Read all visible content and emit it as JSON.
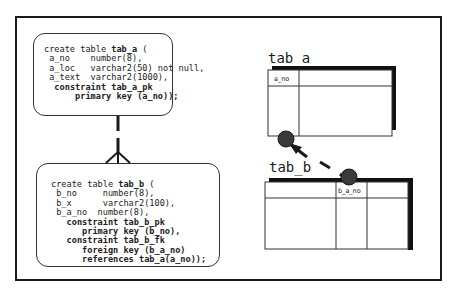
{
  "diagram": {
    "sql_a": {
      "lines": [
        {
          "indent": "",
          "plain": "create table ",
          "bold": "tab_a",
          "rest": " ("
        },
        {
          "indent": " ",
          "plain": "a_no    number(8),",
          "bold": "",
          "rest": ""
        },
        {
          "indent": " ",
          "plain": "a_loc   varchar2(50) not null,",
          "bold": "",
          "rest": ""
        },
        {
          "indent": " ",
          "plain": "a_text  varchar2(1000),",
          "bold": "",
          "rest": ""
        },
        {
          "indent": "  ",
          "plain": "",
          "bold": "constraint tab_a_pk",
          "rest": ""
        },
        {
          "indent": "      ",
          "plain": "",
          "bold": "primary key (a_no));",
          "rest": ""
        }
      ]
    },
    "sql_b": {
      "lines": [
        {
          "indent": "",
          "plain": "create table ",
          "bold": "tab_b",
          "rest": " ("
        },
        {
          "indent": " ",
          "plain": "b_no     number(8),",
          "bold": "",
          "rest": ""
        },
        {
          "indent": " ",
          "plain": "b_x      varchar2(100),",
          "bold": "",
          "rest": ""
        },
        {
          "indent": " ",
          "plain": "b_a_no  number(8),",
          "bold": "",
          "rest": ""
        },
        {
          "indent": "   ",
          "plain": "",
          "bold": "constraint tab_b_pk",
          "rest": ""
        },
        {
          "indent": "      ",
          "plain": "",
          "bold": "primary key (b_no),",
          "rest": ""
        },
        {
          "indent": "   ",
          "plain": "",
          "bold": "constraint tab_b_fk",
          "rest": ""
        },
        {
          "indent": "      ",
          "plain": "",
          "bold": "foreign key (b_a_no)",
          "rest": ""
        },
        {
          "indent": "      ",
          "plain": "",
          "bold": "references tab_a(a_no));",
          "rest": ""
        }
      ]
    },
    "table_a": {
      "title": "tab_a",
      "column": "a_no"
    },
    "table_b": {
      "title": "tab_b",
      "column": "b_a_no"
    },
    "relationship": {
      "type": "one-to-many",
      "icon": "crows-foot-icon",
      "arrow": "foreign-key-arrow"
    },
    "colors": {
      "line": "#1a1a1a",
      "dot": "#3a3a3a",
      "border": "#333333"
    }
  }
}
